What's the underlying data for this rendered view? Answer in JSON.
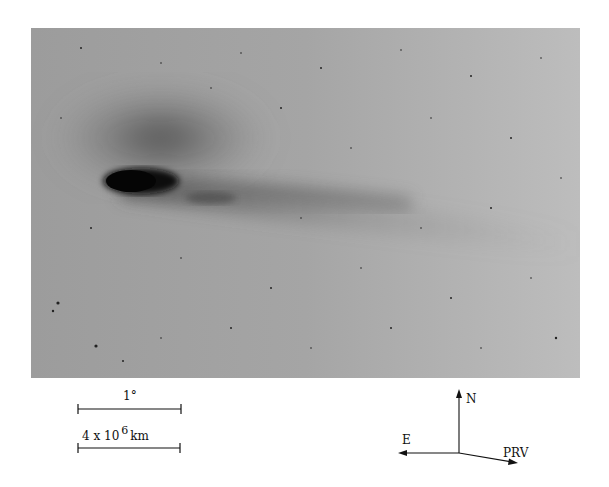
{
  "figure": {
    "background_color": "#a9a9a9",
    "nucleus_color": "#0b0b0b"
  },
  "scale_bars": [
    {
      "label": "1°"
    },
    {
      "label_base": "4 x 10",
      "label_exponent": "6",
      "label_unit": "km"
    }
  ],
  "compass": {
    "north": "N",
    "east": "E",
    "prv": "PRV"
  }
}
